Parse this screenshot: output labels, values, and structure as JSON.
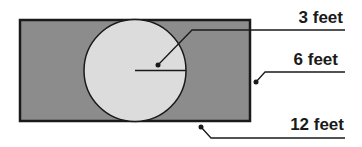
{
  "diagram": {
    "title": "",
    "shapes": {
      "rectangle": {
        "name": "outer-rectangle",
        "fill": "#8c8c8c",
        "stroke": "#1a1a1a",
        "x": 19,
        "y": 19,
        "width": 231,
        "height": 102
      },
      "circle": {
        "name": "inner-circle",
        "fill": "#dcdcdc",
        "stroke": "#1a1a1a",
        "cx": 135,
        "cy": 70,
        "r": 51
      }
    },
    "labels": [
      {
        "text": "3 feet",
        "refers_to": "circle radius"
      },
      {
        "text": "6 feet",
        "refers_to": "rectangle width"
      },
      {
        "text": "12 feet",
        "refers_to": "rectangle length"
      }
    ]
  }
}
